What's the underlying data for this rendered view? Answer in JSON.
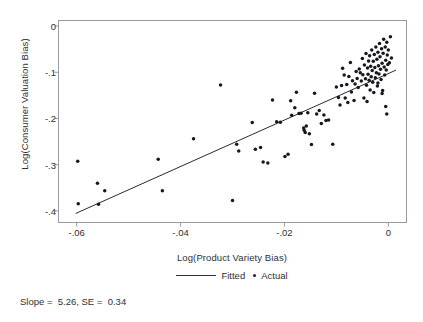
{
  "chart_data": {
    "type": "scatter",
    "title": "",
    "xlabel": "Log(Product Variety Bias)",
    "ylabel": "Log(Consumer Valuation Bias)",
    "xlim": [
      -0.0635,
      0.0035
    ],
    "ylim": [
      -0.425,
      0.012
    ],
    "xticks": [
      -0.06,
      -0.04,
      -0.02,
      0
    ],
    "xticklabels": [
      "-.06",
      "-.04",
      "-.02",
      "0"
    ],
    "yticks": [
      0,
      -0.1,
      -0.2,
      -0.3,
      -0.4
    ],
    "yticklabels": [
      "0",
      "-.1",
      "-.2",
      "-.3",
      "-.4"
    ],
    "grid": false,
    "legend_position": "below-axis",
    "legend": [
      {
        "label": "Fitted",
        "marker": "line"
      },
      {
        "label": "Actual",
        "marker": "dot"
      }
    ],
    "annotation": "Slope =  5.26, SE =  0.34",
    "fit": {
      "slope": 5.26,
      "se": 0.34,
      "x_start": -0.0602,
      "y_start": -0.4055,
      "x_end": 0.0015,
      "y_end": -0.0952
    },
    "series": [
      {
        "name": "Actual",
        "marker": "dot",
        "color": "#17171c",
        "points": [
          [
            -0.0598,
            -0.2925
          ],
          [
            -0.0597,
            -0.3845
          ],
          [
            -0.056,
            -0.34
          ],
          [
            -0.0558,
            -0.3855
          ],
          [
            -0.0546,
            -0.3565
          ],
          [
            -0.0443,
            -0.288
          ],
          [
            -0.0435,
            -0.3565
          ],
          [
            -0.0375,
            -0.244
          ],
          [
            -0.0323,
            -0.1278
          ],
          [
            -0.03,
            -0.3775
          ],
          [
            -0.0292,
            -0.2555
          ],
          [
            -0.0288,
            -0.2705
          ],
          [
            -0.0262,
            -0.2085
          ],
          [
            -0.0256,
            -0.2665
          ],
          [
            -0.0246,
            -0.263
          ],
          [
            -0.0241,
            -0.294
          ],
          [
            -0.0232,
            -0.2965
          ],
          [
            -0.0223,
            -0.16
          ],
          [
            -0.0215,
            -0.207
          ],
          [
            -0.0208,
            -0.208
          ],
          [
            -0.0199,
            -0.282
          ],
          [
            -0.0193,
            -0.2775
          ],
          [
            -0.0188,
            -0.1615
          ],
          [
            -0.0186,
            -0.193
          ],
          [
            -0.018,
            -0.177
          ],
          [
            -0.0177,
            -0.143
          ],
          [
            -0.0172,
            -0.189
          ],
          [
            -0.0168,
            -0.1885
          ],
          [
            -0.0163,
            -0.2205
          ],
          [
            -0.0162,
            -0.2255
          ],
          [
            -0.016,
            -0.2305
          ],
          [
            -0.0158,
            -0.2165
          ],
          [
            -0.0155,
            -0.1875
          ],
          [
            -0.0152,
            -0.233
          ],
          [
            -0.0148,
            -0.256
          ],
          [
            -0.0142,
            -0.1455
          ],
          [
            -0.0138,
            -0.1905
          ],
          [
            -0.0133,
            -0.1825
          ],
          [
            -0.0129,
            -0.211
          ],
          [
            -0.0124,
            -0.1925
          ],
          [
            -0.012,
            -0.2045
          ],
          [
            -0.0115,
            -0.2035
          ],
          [
            -0.0107,
            -0.2555
          ],
          [
            -0.01,
            -0.132
          ],
          [
            -0.0096,
            -0.1545
          ],
          [
            -0.0093,
            -0.171
          ],
          [
            -0.009,
            -0.1285
          ],
          [
            -0.0088,
            -0.0915
          ],
          [
            -0.0085,
            -0.106
          ],
          [
            -0.0083,
            -0.1555
          ],
          [
            -0.008,
            -0.1265
          ],
          [
            -0.0078,
            -0.1655
          ],
          [
            -0.0076,
            -0.109
          ],
          [
            -0.0073,
            -0.079
          ],
          [
            -0.0071,
            -0.1425
          ],
          [
            -0.0069,
            -0.1185
          ],
          [
            -0.0066,
            -0.161
          ],
          [
            -0.0064,
            -0.1255
          ],
          [
            -0.0062,
            -0.0985
          ],
          [
            -0.006,
            -0.1135
          ],
          [
            -0.0058,
            -0.133
          ],
          [
            -0.0056,
            -0.093
          ],
          [
            -0.0054,
            -0.101
          ],
          [
            -0.0052,
            -0.119
          ],
          [
            -0.005,
            -0.07
          ],
          [
            -0.0049,
            -0.1055
          ],
          [
            -0.0047,
            -0.1555
          ],
          [
            -0.0046,
            -0.0845
          ],
          [
            -0.0044,
            -0.114
          ],
          [
            -0.0043,
            -0.0595
          ],
          [
            -0.0042,
            -0.128
          ],
          [
            -0.0041,
            -0.163
          ],
          [
            -0.004,
            -0.0905
          ],
          [
            -0.0039,
            -0.1045
          ],
          [
            -0.0038,
            -0.0755
          ],
          [
            -0.0037,
            -0.117
          ],
          [
            -0.0036,
            -0.064
          ],
          [
            -0.0035,
            -0.1385
          ],
          [
            -0.0034,
            -0.087
          ],
          [
            -0.0033,
            -0.1095
          ],
          [
            -0.0032,
            -0.052
          ],
          [
            -0.0031,
            -0.096
          ],
          [
            -0.003,
            -0.1215
          ],
          [
            -0.0029,
            -0.076
          ],
          [
            -0.0028,
            -0.1435
          ],
          [
            -0.0027,
            -0.0615
          ],
          [
            -0.0026,
            -0.0895
          ],
          [
            -0.0025,
            -0.112
          ],
          [
            -0.0024,
            -0.0455
          ],
          [
            -0.0023,
            -0.101
          ],
          [
            -0.0022,
            -0.072
          ],
          [
            -0.0021,
            -0.1295
          ],
          [
            -0.002,
            -0.0565
          ],
          [
            -0.0019,
            -0.086
          ],
          [
            -0.0018,
            -0.104
          ],
          [
            -0.0017,
            -0.0375
          ],
          [
            -0.0016,
            -0.0665
          ],
          [
            -0.0015,
            -0.0935
          ],
          [
            -0.0014,
            -0.1155
          ],
          [
            -0.0013,
            -0.049
          ],
          [
            -0.0012,
            -0.0805
          ],
          [
            -0.0011,
            -0.1395
          ],
          [
            -0.001,
            -0.059
          ],
          [
            -0.0009,
            -0.0285
          ],
          [
            -0.0008,
            -0.0885
          ],
          [
            -0.0007,
            -0.106
          ],
          [
            -0.0006,
            -0.0455
          ],
          [
            -0.0005,
            -0.074
          ],
          [
            -0.0004,
            -0.095
          ],
          [
            -0.0003,
            -0.035
          ],
          [
            -0.0002,
            -0.0625
          ],
          [
            -0.0001,
            -0.083
          ],
          [
            -0.0005,
            -0.174
          ],
          [
            -0.0003,
            -0.1905
          ],
          [
            -0.0012,
            -0.146
          ],
          [
            -0.002,
            -0.123
          ],
          [
            0.0,
            -0.052
          ],
          [
            0.0002,
            -0.0795
          ],
          [
            0.0004,
            -0.023
          ],
          [
            0.0006,
            -0.069
          ]
        ]
      }
    ]
  }
}
